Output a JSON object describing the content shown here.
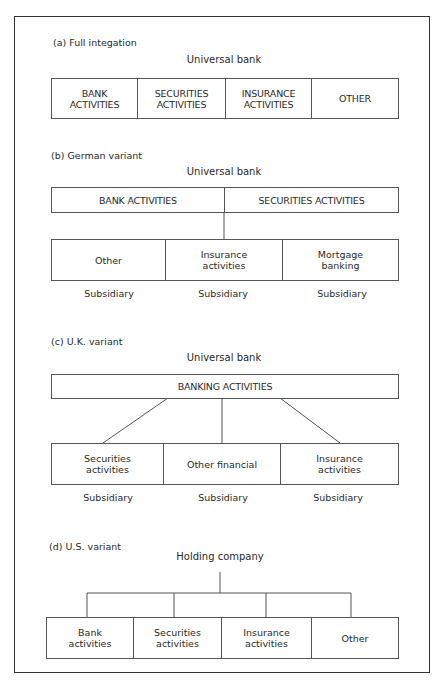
{
  "diagram": {
    "sections": [
      {
        "id": "a",
        "label": "(a) Full integation",
        "title": "Universal bank",
        "boxes": [
          "BANK ACTIVITIES",
          "SECURITIES ACTIVITIES",
          "INSURANCE ACTIVITIES",
          "OTHER"
        ]
      },
      {
        "id": "b",
        "label": "(b) German variant",
        "title": "Universal bank",
        "top_boxes": [
          "BANK ACTIVITIES",
          "SECURITIES ACTIVITIES"
        ],
        "sub_boxes": [
          "Other",
          "Insurance activities",
          "Mortgage banking"
        ],
        "sub_labels": [
          "Subsidiary",
          "Subsidiary",
          "Subsidiary"
        ]
      },
      {
        "id": "c",
        "label": "(c) U.K. variant",
        "title": "Universal bank",
        "top_box": "BANKING ACTIVITIES",
        "sub_boxes": [
          "Securities activities",
          "Other financial",
          "Insurance activities"
        ],
        "sub_labels": [
          "Subsidiary",
          "Subsidiary",
          "Subsidiary"
        ]
      },
      {
        "id": "d",
        "label": "(d) U.S. variant",
        "title": "Holding company",
        "boxes": [
          "Bank activities",
          "Securities activities",
          "Insurance activities",
          "Other"
        ]
      }
    ]
  },
  "a_boxes": {
    "b0l1": "BANK",
    "b0l2": "ACTIVITIES",
    "b1l1": "SECURITIES",
    "b1l2": "ACTIVITIES",
    "b2l1": "INSURANCE",
    "b2l2": "ACTIVITIES",
    "b3": "OTHER"
  },
  "b_sub": {
    "s0": "Other",
    "s1l1": "Insurance",
    "s1l2": "activities",
    "s2l1": "Mortgage",
    "s2l2": "banking"
  },
  "c_sub": {
    "s0l1": "Securities",
    "s0l2": "activities",
    "s1": "Other financial",
    "s2l1": "Insurance",
    "s2l2": "activities"
  },
  "d_boxes": {
    "b0l1": "Bank",
    "b0l2": "activities",
    "b1l1": "Securities",
    "b1l2": "activities",
    "b2l1": "Insurance",
    "b2l2": "activities",
    "b3": "Other"
  },
  "colors": {
    "line": "#555555",
    "frame": "#333333",
    "text": "#2a2a2a"
  }
}
